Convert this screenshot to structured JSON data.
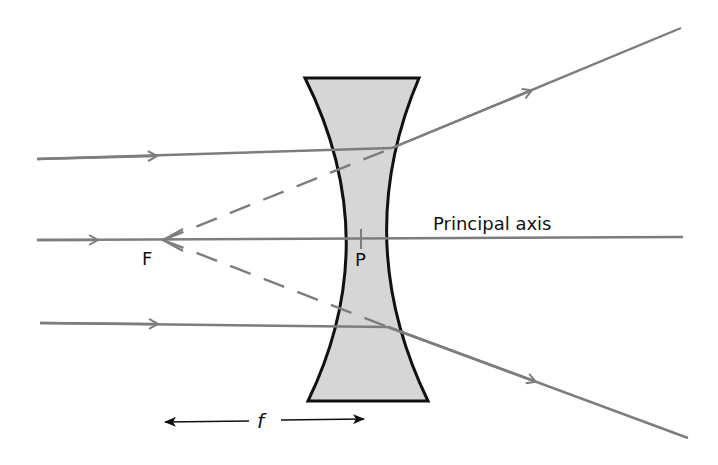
{
  "diagram": {
    "labels": {
      "focal_point": "F",
      "optical_centre": "P",
      "axis": "Principal axis",
      "focal_length": "f"
    },
    "colors": {
      "ray": "#7d7d7d",
      "lens_fill": "#d6d6d6",
      "lens_outline": "#111111",
      "text": "#111111"
    }
  }
}
